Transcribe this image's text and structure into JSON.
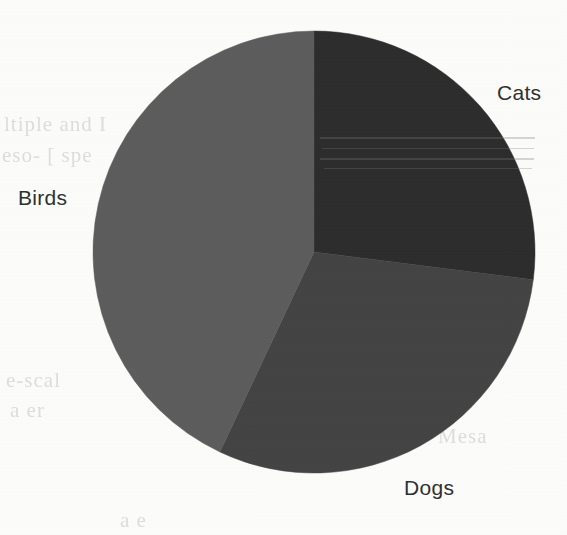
{
  "figure": {
    "background_color": "#fcfcfa",
    "label_color": "#2e2e2e"
  },
  "labels": {
    "cats": "Cats",
    "birds": "Birds",
    "dogs": "Dogs"
  },
  "background_bleed_text": {
    "line1": "ltiple and I",
    "line2": "eso- [ spe",
    "line3": "lgrit",
    "line4": "as",
    "line5": "e-scal",
    "line6": "a  er",
    "line7": "bre",
    "line8": "ap e",
    "line9": "Mesa",
    "line10": "a e"
  },
  "chart_data": {
    "type": "pie",
    "title": "",
    "categories": [
      "Cats",
      "Dogs",
      "Birds"
    ],
    "values": [
      27,
      30,
      43
    ],
    "value_unit": "percent",
    "colors": [
      "#2b2b2b",
      "#424242",
      "#5b5b5b"
    ],
    "start_angle_deg": 90,
    "direction": "clockwise",
    "labels_shown": true,
    "legend": false,
    "grid": false,
    "center_px": [
      314,
      252
    ],
    "radius_px": 221,
    "slice_boundaries_deg": [
      0,
      98,
      205,
      360
    ]
  }
}
